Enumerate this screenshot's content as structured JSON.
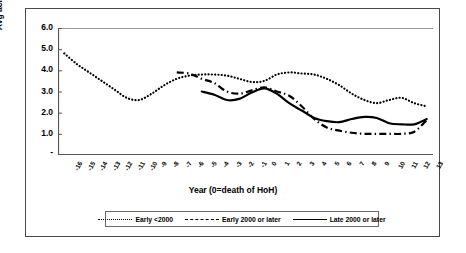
{
  "chart_data": {
    "type": "line",
    "title": "",
    "xlabel": "Year (0=death of HoH)",
    "ylabel": "Avg acres",
    "ylim": [
      0,
      6
    ],
    "yticks": [
      "-",
      "1.0",
      "2.0",
      "3.0",
      "4.0",
      "5.0",
      "6.0"
    ],
    "grid": false,
    "legend_position": "bottom",
    "x": [
      -16,
      -15,
      -14,
      -13,
      -12,
      -11,
      -10,
      -9,
      -8,
      -7,
      -6,
      -5,
      -4,
      -3,
      -2,
      -1,
      0,
      1,
      2,
      3,
      4,
      5,
      6,
      7,
      8,
      9,
      10,
      11,
      12,
      13
    ],
    "xticklabels": [
      "-16",
      "-15",
      "-14",
      "-13",
      "-12",
      "-11",
      "-10",
      "-9",
      "-8",
      "-7",
      "-6",
      "-5",
      "-4",
      "-3",
      "-2",
      "-1",
      "0",
      "1",
      "2",
      "3",
      "4",
      "5",
      "6",
      "7",
      "8",
      "9",
      "10",
      "11",
      "12",
      "13"
    ],
    "series": [
      {
        "name": "Early <2000",
        "style": "dotted",
        "color": "#000000",
        "values": [
          4.8,
          4.3,
          3.9,
          3.5,
          3.1,
          2.7,
          2.6,
          2.9,
          3.3,
          3.6,
          3.75,
          3.8,
          3.8,
          3.75,
          3.6,
          3.45,
          3.5,
          3.8,
          3.9,
          3.85,
          3.8,
          3.6,
          3.3,
          2.9,
          2.6,
          2.45,
          2.6,
          2.7,
          2.45,
          2.3
        ]
      },
      {
        "name": "Early 2000 or later",
        "style": "dashdot",
        "color": "#000000",
        "values": [
          null,
          null,
          null,
          null,
          null,
          null,
          null,
          null,
          null,
          3.9,
          3.85,
          3.6,
          3.4,
          3.0,
          2.9,
          3.05,
          3.2,
          3.0,
          2.8,
          2.3,
          1.7,
          1.3,
          1.15,
          1.05,
          1.0,
          1.0,
          1.0,
          1.0,
          1.1,
          1.65
        ]
      },
      {
        "name": "Late 2000 or later",
        "style": "solid",
        "color": "#000000",
        "values": [
          null,
          null,
          null,
          null,
          null,
          null,
          null,
          null,
          null,
          null,
          null,
          3.0,
          2.85,
          2.6,
          2.65,
          2.95,
          3.15,
          2.9,
          2.45,
          2.1,
          1.75,
          1.6,
          1.55,
          1.7,
          1.8,
          1.75,
          1.5,
          1.45,
          1.45,
          1.7
        ]
      }
    ],
    "legend": [
      {
        "label": "Early <2000",
        "style": "dotted"
      },
      {
        "label": "Early 2000 or later",
        "style": "dashdot"
      },
      {
        "label": "Late 2000 or later",
        "style": "solid"
      }
    ]
  }
}
